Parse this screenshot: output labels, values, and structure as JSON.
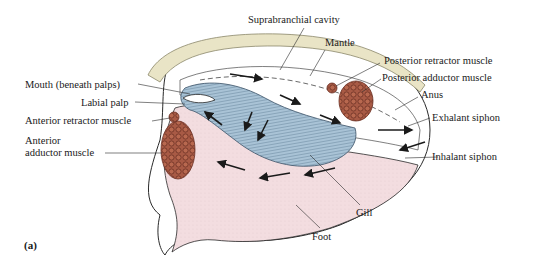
{
  "figure": {
    "panel_label": "(a)",
    "colors": {
      "shell_edge": "#e9e4c6",
      "mantle": "#ffffff",
      "gill": "#a9c3d6",
      "gill_lines": "#5f7e97",
      "foot": "#f3dde0",
      "muscle": "#a85a45",
      "muscle_cells": "#6b2e22",
      "outline": "#2a2a2a"
    },
    "labels": {
      "suprabranchial_cavity": "Suprabranchial cavity",
      "mantle": "Mantle",
      "posterior_retractor": "Posterior retractor muscle",
      "posterior_adductor": "Posterior adductor muscle",
      "anus": "Anus",
      "exhalant_siphon": "Exhalant siphon",
      "inhalant_siphon": "Inhalant siphon",
      "mouth": "Mouth (beneath palps)",
      "labial_palp": "Labial palp",
      "anterior_retractor": "Anterior retractor muscle",
      "anterior_adductor_1": "Anterior",
      "anterior_adductor_2": "adductor muscle",
      "gill": "Gill",
      "foot": "Foot"
    }
  }
}
